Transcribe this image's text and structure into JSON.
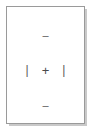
{
  "panel": {
    "name": "nudge-control-panel",
    "background_color": "#ffffff",
    "border_color": "#9a9a9a",
    "shadow_color": "#c9c9c9",
    "glyph_color": "#5a5a5a",
    "width_px": 93,
    "height_px": 132
  },
  "controls": {
    "top": {
      "icon": "minus-icon",
      "label": "–"
    },
    "left": {
      "icon": "vertical-bar-icon",
      "label": "|"
    },
    "center": {
      "icon": "plus-icon",
      "label": "+"
    },
    "right": {
      "icon": "vertical-bar-icon",
      "label": "|"
    },
    "bottom": {
      "icon": "minus-icon",
      "label": "–"
    }
  }
}
